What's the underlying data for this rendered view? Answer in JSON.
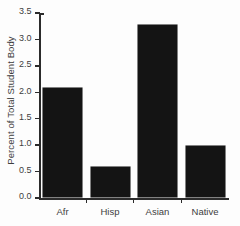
{
  "chart_data": {
    "type": "bar",
    "title": "",
    "xlabel": "",
    "ylabel": "Percent of Total Student Body",
    "categories": [
      "Afr",
      "Hisp",
      "Asian",
      "Native"
    ],
    "values": [
      2.1,
      0.6,
      3.3,
      1.0
    ],
    "ylim": [
      0.0,
      3.5
    ],
    "ytick_labels": [
      "0.0",
      "0.5",
      "1.0",
      "1.5",
      "2.0",
      "2.5",
      "3.0",
      "3.5"
    ],
    "ytick_values": [
      0.0,
      0.5,
      1.0,
      1.5,
      2.0,
      2.5,
      3.0,
      3.5
    ],
    "grid": false,
    "legend": null,
    "bar_color": "#141414",
    "axis_color": "#2b2b2b",
    "text_color": "#3d3d3d",
    "background_color": "#fdfdfd"
  }
}
